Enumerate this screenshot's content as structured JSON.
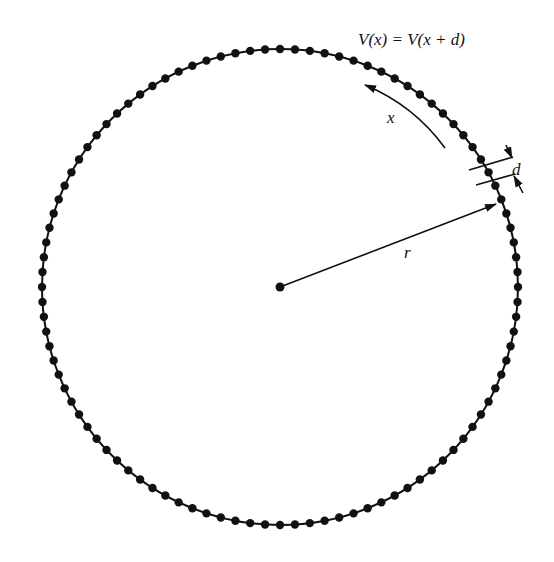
{
  "diagram": {
    "equation": "V(x) = V(x + d)",
    "labels": {
      "arc_coordinate": "x",
      "lattice_spacing": "d",
      "radius": "r"
    },
    "ring": {
      "center": [
        280,
        287
      ],
      "radius": 238,
      "site_count": 100,
      "site_radius": 4.2,
      "color": "#111111"
    },
    "arrows": {
      "radius_arrow": {
        "from": [
          280,
          287
        ],
        "to": [
          498,
          203
        ]
      },
      "arc_arrow_direction": "counterclockwise"
    }
  }
}
